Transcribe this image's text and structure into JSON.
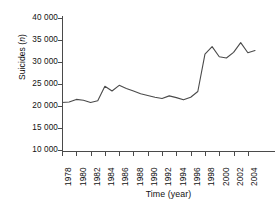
{
  "chart_data": {
    "type": "line",
    "title": "",
    "xlabel": "Time (year)",
    "ylabel": "Suicides (n)",
    "ylabel_plain": "Suicides (",
    "ylabel_italic": "n",
    "ylabel_tail": ")",
    "xlim": [
      1978,
      2005
    ],
    "ylim": [
      10000,
      40000
    ],
    "ytick_values": [
      40000,
      35000,
      30000,
      25000,
      20000,
      15000,
      10000
    ],
    "ytick_labels": [
      "40 000",
      "35 000",
      "30 000",
      "25 000",
      "20 000",
      "15 000",
      "10 000"
    ],
    "xtick_values": [
      1978,
      1980,
      1982,
      1984,
      1986,
      1988,
      1990,
      1992,
      1994,
      1996,
      1998,
      2000,
      2002,
      2004
    ],
    "xtick_labels": [
      "1978",
      "1980",
      "1982",
      "1984",
      "1986",
      "1988",
      "1990",
      "1992",
      "1994",
      "1996",
      "1998",
      "2000",
      "2002",
      "2004"
    ],
    "grid": false,
    "legend": false,
    "line_color": "#4a4a4a",
    "x": [
      1978,
      1979,
      1980,
      1981,
      1982,
      1983,
      1984,
      1985,
      1986,
      1987,
      1988,
      1989,
      1990,
      1991,
      1992,
      1993,
      1994,
      1995,
      1996,
      1997,
      1998,
      1999,
      2000,
      2001,
      2002,
      2003,
      2004,
      2005
    ],
    "values": [
      20800,
      20900,
      21500,
      21300,
      20800,
      21200,
      24500,
      23400,
      24700,
      24000,
      23400,
      22800,
      22400,
      22000,
      21700,
      22300,
      21900,
      21400,
      22000,
      23300,
      31800,
      33500,
      31200,
      30900,
      32200,
      34400,
      32100,
      32600
    ],
    "series": [
      {
        "name": "Suicides",
        "values": [
          20800,
          20900,
          21500,
          21300,
          20800,
          21200,
          24500,
          23400,
          24700,
          24000,
          23400,
          22800,
          22400,
          22000,
          21700,
          22300,
          21900,
          21400,
          22000,
          23300,
          31800,
          33500,
          31200,
          30900,
          32200,
          34400,
          32100,
          32600
        ]
      }
    ]
  }
}
